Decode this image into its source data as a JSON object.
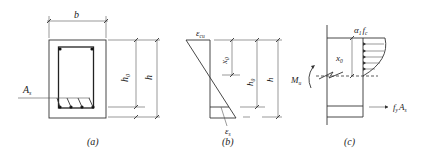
{
  "figure": {
    "panels": [
      {
        "id": "a",
        "caption": "(a)",
        "title": "Cross-section",
        "labels": {
          "width": "b",
          "effective_depth": "h",
          "effective_depth_sub": "0",
          "height": "h",
          "steel_area": "A",
          "steel_area_sub": "s"
        }
      },
      {
        "id": "b",
        "caption": "(b)",
        "title": "Strain distribution",
        "labels": {
          "top_strain": "ε",
          "top_strain_sub": "cu",
          "neutral_axis_depth": "x",
          "neutral_axis_depth_sub": "0",
          "effective_depth": "h",
          "effective_depth_sub": "0",
          "height": "h",
          "steel_strain": "ε",
          "steel_strain_sub": "s"
        }
      },
      {
        "id": "c",
        "caption": "(c)",
        "title": "Stress distribution",
        "labels": {
          "concrete_stress": "α",
          "concrete_stress_sub1": "1",
          "concrete_stress_f": "f",
          "concrete_stress_sub2": "c",
          "compression_depth": "x",
          "compression_depth_sub": "0",
          "moment": "M",
          "moment_sub": "u",
          "steel_force_f": "f",
          "steel_force_sub1": "y",
          "steel_force_A": "A",
          "steel_force_sub2": "s"
        }
      }
    ],
    "colors": {
      "line": "#333333",
      "background": "#ffffff"
    }
  }
}
